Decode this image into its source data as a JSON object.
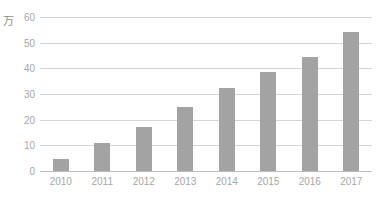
{
  "chart_data": {
    "type": "bar",
    "title": "",
    "subtitle": "",
    "xlabel": "",
    "ylabel": "万",
    "unit_label": "万",
    "categories": [
      "2010",
      "2011",
      "2012",
      "2013",
      "2014",
      "2015",
      "2016",
      "2017"
    ],
    "values": [
      4.5,
      10.8,
      17,
      25,
      32.5,
      38.5,
      44.5,
      54
    ],
    "ylim": [
      0,
      60
    ],
    "yticks": [
      0,
      10,
      20,
      30,
      40,
      50,
      60
    ],
    "ytick_labels": [
      "0",
      "10",
      "20",
      "30",
      "40",
      "50",
      "60"
    ],
    "grid": true,
    "legend": false,
    "legend_position": "none",
    "series": [
      {
        "name": "",
        "values": [
          4.5,
          10.8,
          17,
          25,
          32.5,
          38.5,
          44.5,
          54
        ]
      }
    ],
    "colors": {
      "bar": "#a3a3a3",
      "gridline": "#d4d4d4",
      "axis": "#bdbdbd",
      "tick_text": "#a6a6a6",
      "unit_text": "#8c8c8c",
      "background": "#ffffff"
    }
  }
}
